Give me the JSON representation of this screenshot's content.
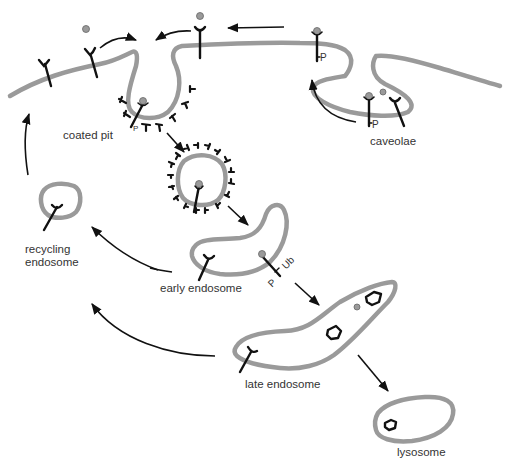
{
  "diagram": {
    "type": "receptor-mediated endocytosis pathway",
    "labels": {
      "coated_pit": "coated pit",
      "caveolae": "caveolae",
      "recycling_endosome_line1": "recycling",
      "recycling_endosome_line2": "endosome",
      "early_endosome": "early endosome",
      "late_endosome": "late endosome",
      "lysosome": "lysosome"
    },
    "annotations": {
      "phospho_caveola_surface": "P",
      "phospho_caveola_inner": "P",
      "phospho_coated_pit": "P",
      "phospho_early_endosome": "P",
      "ubiquitin_early_endosome": "Ub"
    },
    "colors": {
      "membrane": "#9a9a9a",
      "receptor": "#111111",
      "ligand": "#9a9a9a",
      "text": "#333333"
    },
    "nodes": [
      "plasma membrane",
      "coated pit",
      "coated vesicle",
      "caveolae",
      "early endosome",
      "recycling endosome",
      "late endosome",
      "lysosome"
    ],
    "edges": [
      {
        "from": "plasma membrane",
        "to": "coated pit"
      },
      {
        "from": "caveolae",
        "to": "plasma membrane"
      },
      {
        "from": "plasma membrane (P-receptor)",
        "to": "plasma membrane (receptor)"
      },
      {
        "from": "coated pit",
        "to": "coated vesicle"
      },
      {
        "from": "coated vesicle",
        "to": "early endosome"
      },
      {
        "from": "early endosome",
        "to": "late endosome"
      },
      {
        "from": "late endosome",
        "to": "lysosome"
      },
      {
        "from": "early endosome",
        "to": "recycling endosome"
      },
      {
        "from": "late endosome",
        "to": "recycling endosome"
      },
      {
        "from": "recycling endosome",
        "to": "plasma membrane"
      }
    ]
  }
}
